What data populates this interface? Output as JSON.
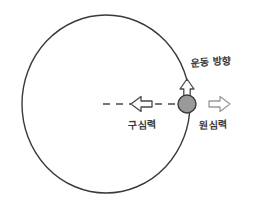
{
  "diagram": {
    "background_color": "#ffffff",
    "stroke_color": "#3a3a3a",
    "ball_fill_color": "#9a9a9a",
    "orbit": {
      "name": "circular-orbit-path",
      "center_x": 106,
      "center_y": 104,
      "radius_x": 84,
      "radius_y": 89,
      "stroke_width": 1.4,
      "style": "solid"
    },
    "ball": {
      "name": "orbiting-ball",
      "x": 187,
      "y": 104,
      "radius": 9,
      "fill": "#9a9a9a",
      "stroke": "#3a3a3a"
    },
    "radius_line": {
      "name": "radius-dashed-line",
      "x1": 103,
      "x2": 187,
      "y": 104,
      "style": "dashed"
    },
    "arrows": [
      {
        "name": "motion-direction-arrow",
        "direction": "up",
        "style": "hollow",
        "x": 187,
        "y_tip": 80,
        "y_tail": 98,
        "label": "운동 방향"
      },
      {
        "name": "centripetal-force-arrow",
        "direction": "left",
        "style": "hollow",
        "x_tip": 131,
        "x_tail": 152,
        "y": 104,
        "label": "구심력"
      },
      {
        "name": "centrifugal-force-arrow",
        "direction": "right",
        "style": "hollow",
        "x_tail": 209,
        "x_tip": 230,
        "y": 104,
        "label": "원심력"
      }
    ],
    "labels": {
      "motion_direction": "운동 방향",
      "centripetal_force": "구심력",
      "centrifugal_force": "원심력"
    }
  }
}
